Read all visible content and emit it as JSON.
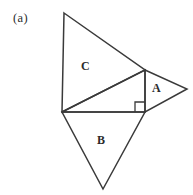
{
  "figure": {
    "panel_tag": "(a)",
    "background_color": "#ffffff",
    "stroke_color": "#3a3a3a",
    "label_color": "#2b2b2b",
    "width": 193,
    "height": 195,
    "labels": {
      "a": "A",
      "b": "B",
      "c": "C"
    },
    "shapes": {
      "central_right_triangle": {
        "name": "central-right-triangle",
        "points": "62,112 145,112 145,70",
        "right_angle_vertex": "145,112"
      },
      "triangle_c": {
        "name": "triangle-c",
        "points": "64,13 145,70 62,112"
      },
      "triangle_a": {
        "name": "triangle-a",
        "points": "145,70 187,89 145,112"
      },
      "triangle_b": {
        "name": "triangle-b",
        "points": "62,112 145,112 103,189"
      },
      "right_angle_marker": {
        "name": "right-angle-marker",
        "points": "135,112 135,102 145,102"
      }
    }
  }
}
